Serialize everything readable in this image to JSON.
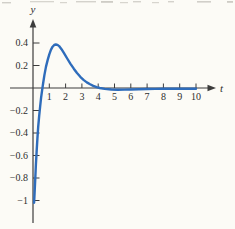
{
  "figure": {
    "width": 235,
    "height": 229,
    "background": "#fcfbf6",
    "axis_color": "#3c3c3c",
    "tick_label_color": "#2e2e2e",
    "curve_color": "#2e6cbb",
    "x_axis_label": "t",
    "y_axis_label": "y"
  },
  "chart_data": {
    "type": "line",
    "title": "",
    "xlabel": "t",
    "ylabel": "y",
    "xlim": [
      -1.4,
      12.4
    ],
    "ylim": [
      -1.25,
      0.62
    ],
    "grid": false,
    "legend_position": "none",
    "x_ticks": [
      1,
      2,
      3,
      4,
      5,
      6,
      7,
      8,
      9,
      10
    ],
    "x_tick_labels": [
      "1",
      "2",
      "3",
      "4",
      "5",
      "6",
      "7",
      "8",
      "9",
      "10"
    ],
    "y_ticks": [
      {
        "value": 0.4,
        "label": "0.4"
      },
      {
        "value": 0.2,
        "label": "0.2"
      },
      {
        "value": -0.2,
        "label": "−0.2"
      },
      {
        "value": -0.4,
        "label": "−0.4"
      },
      {
        "value": -0.6,
        "label": "−0.6"
      },
      {
        "value": -0.8,
        "label": "−0.8"
      },
      {
        "value": -1,
        "label": "−1"
      }
    ],
    "series": [
      {
        "name": "solution-curve",
        "color": "#2e6cbb",
        "points": [
          [
            0.07,
            -1.02
          ],
          [
            0.1,
            -0.93
          ],
          [
            0.14,
            -0.8
          ],
          [
            0.18,
            -0.68
          ],
          [
            0.22,
            -0.57
          ],
          [
            0.27,
            -0.45
          ],
          [
            0.32,
            -0.345
          ],
          [
            0.38,
            -0.245
          ],
          [
            0.44,
            -0.16
          ],
          [
            0.5,
            -0.085
          ],
          [
            0.56,
            -0.02
          ],
          [
            0.62,
            0.04
          ],
          [
            0.7,
            0.115
          ],
          [
            0.8,
            0.19
          ],
          [
            0.9,
            0.25
          ],
          [
            1.0,
            0.3
          ],
          [
            1.1,
            0.34
          ],
          [
            1.2,
            0.367
          ],
          [
            1.3,
            0.382
          ],
          [
            1.4,
            0.387
          ],
          [
            1.5,
            0.383
          ],
          [
            1.6,
            0.372
          ],
          [
            1.75,
            0.345
          ],
          [
            1.9,
            0.31
          ],
          [
            2.1,
            0.262
          ],
          [
            2.3,
            0.215
          ],
          [
            2.5,
            0.172
          ],
          [
            2.7,
            0.133
          ],
          [
            2.9,
            0.1
          ],
          [
            3.1,
            0.072
          ],
          [
            3.3,
            0.05
          ],
          [
            3.5,
            0.033
          ],
          [
            3.7,
            0.019
          ],
          [
            3.9,
            0.008
          ],
          [
            4.1,
            0.0
          ],
          [
            4.4,
            -0.008
          ],
          [
            4.8,
            -0.013
          ],
          [
            5.2,
            -0.015
          ],
          [
            5.6,
            -0.014
          ],
          [
            6.0,
            -0.013
          ],
          [
            6.5,
            -0.011
          ],
          [
            7.0,
            -0.009
          ],
          [
            7.5,
            -0.008
          ],
          [
            8.0,
            -0.007
          ],
          [
            8.5,
            -0.007
          ],
          [
            9.0,
            -0.006
          ],
          [
            9.5,
            -0.006
          ],
          [
            10.0,
            -0.006
          ]
        ]
      }
    ]
  }
}
